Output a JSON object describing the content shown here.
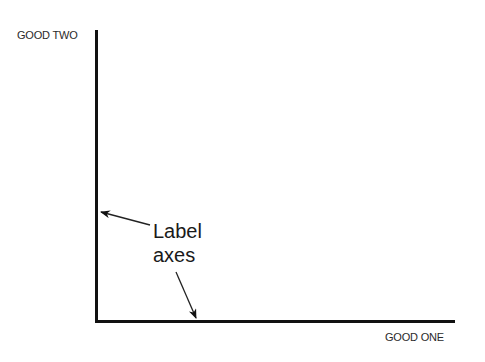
{
  "diagram": {
    "y_axis_label": "GOOD TWO",
    "x_axis_label": "GOOD ONE",
    "annotation": {
      "line1": "Label",
      "line2": "axes"
    },
    "colors": {
      "axis": "#111111",
      "text": "#1a1a1a",
      "background": "#ffffff"
    }
  }
}
